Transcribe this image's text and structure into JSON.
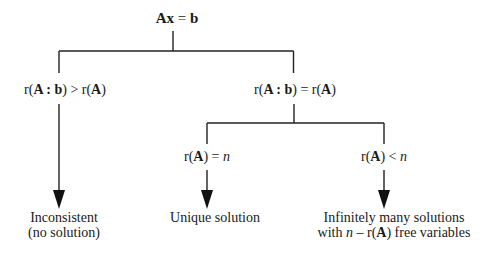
{
  "root": {
    "parts": [
      "Ax",
      " = ",
      "b"
    ],
    "text": "Ax = b"
  },
  "branches": {
    "left": {
      "condition": {
        "r1": "r(",
        "A1": "A",
        "colon": " : ",
        "b": "b",
        "r1close": ") > r(",
        "A2": "A",
        "close": ")",
        "text": "r(A : b) > r(A)"
      },
      "outcome": {
        "line1": "Inconsistent",
        "line2": "(no solution)"
      }
    },
    "right": {
      "condition": {
        "r1": "r(",
        "A1": "A",
        "colon": " : ",
        "b": "b",
        "r1close": ") = r(",
        "A2": "A",
        "close": ")",
        "text": "r(A : b) = r(A)"
      },
      "sub_branches": [
        {
          "condition": {
            "r": "r(",
            "A": "A",
            "rel": ") = ",
            "n": "n",
            "text": "r(A) = n"
          },
          "outcome": {
            "line1": "Unique solution"
          }
        },
        {
          "condition": {
            "r": "r(",
            "A": "A",
            "rel": ") < ",
            "n": "n",
            "text": "r(A) < n"
          },
          "outcome": {
            "line1": "Infinitely many solutions",
            "line2_pre": "with ",
            "line2_n": "n",
            "line2_mid": " – r(",
            "line2_A": "A",
            "line2_post": ") free variables",
            "line2": "with n – r(A) free variables"
          }
        }
      ]
    }
  },
  "colors": {
    "line": "#222222",
    "text": "#1a1a1a",
    "background": "#ffffff"
  }
}
